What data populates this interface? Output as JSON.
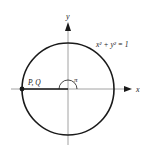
{
  "diagram": {
    "axes": {
      "x_label": "x",
      "y_label": "y"
    },
    "circle": {
      "equation": "x² + y² = 1"
    },
    "angle": {
      "label": "π"
    },
    "point": {
      "label": "P, Q"
    },
    "colors": {
      "stroke": "#1a1a1a",
      "axis": "#8a8a8a",
      "background": "#ffffff"
    }
  }
}
